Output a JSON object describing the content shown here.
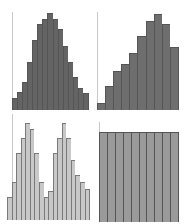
{
  "chart_data": [
    {
      "type": "bar",
      "title": "",
      "xlabel": "",
      "ylabel": "",
      "description": "unimodal symmetric histogram",
      "values": [
        11,
        16,
        25,
        43,
        63,
        77,
        82,
        87,
        82,
        73,
        58,
        43,
        30,
        20,
        15
      ],
      "ylim": [
        0,
        90
      ],
      "grid": false,
      "fill": "#646464",
      "edge": "#555555"
    },
    {
      "type": "bar",
      "title": "",
      "xlabel": "",
      "ylabel": "",
      "description": "left-skewed histogram",
      "values": [
        6,
        22,
        35,
        41,
        51,
        67,
        80,
        86,
        77,
        57
      ],
      "ylim": [
        0,
        90
      ],
      "grid": false,
      "fill": "#6e6e6e",
      "edge": "#555555"
    },
    {
      "type": "bar",
      "title": "",
      "xlabel": "",
      "ylabel": "",
      "description": "bimodal histogram",
      "values": [
        22,
        36,
        64,
        78,
        92,
        86,
        64,
        36,
        22,
        28,
        64,
        78,
        92,
        78,
        57,
        43,
        36,
        29
      ],
      "ylim": [
        0,
        95
      ],
      "grid": false,
      "fill": "#c8c8c8",
      "edge": "#7a7a7a"
    },
    {
      "type": "bar",
      "title": "",
      "xlabel": "",
      "ylabel": "",
      "description": "uniform histogram",
      "values": [
        60,
        60,
        60,
        60,
        60,
        60,
        60,
        60,
        60,
        60
      ],
      "ylim": [
        0,
        60
      ],
      "grid": false,
      "fill": "#9a9a9a",
      "edge": "#555555"
    }
  ],
  "panels": [
    {
      "left": 12,
      "top": 10,
      "width": 77,
      "height": 100,
      "max": 90
    },
    {
      "left": 97,
      "top": 10,
      "width": 82,
      "height": 100,
      "max": 90
    },
    {
      "left": 7,
      "top": 120,
      "width": 83,
      "height": 100,
      "max": 95
    },
    {
      "left": 99,
      "top": 132,
      "width": 80,
      "height": 90,
      "max": 60
    }
  ]
}
